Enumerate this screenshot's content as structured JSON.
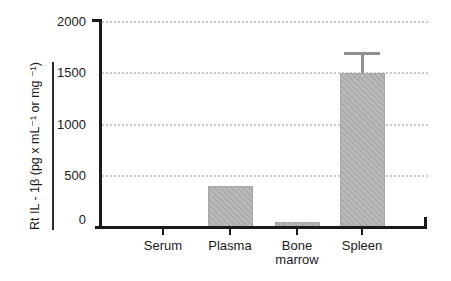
{
  "figure": {
    "background_color": "#ffffff",
    "axis_color": "#1a1a1a",
    "bar_fill_color": "#b5b5b5",
    "error_bar_color": "#8f8f8f",
    "gridline_color": "#cbcbcb",
    "text_color": "#1a1a1a"
  },
  "chart_data": {
    "type": "bar",
    "title": "",
    "xlabel": "",
    "ylabel": "Rt IL - 1β  (pg x mL⁻¹ or mg ⁻¹)",
    "categories": [
      "Serum",
      "Plasma",
      "Bone marrow",
      "Spleen"
    ],
    "values": [
      0,
      400,
      50,
      1500
    ],
    "errors": [
      null,
      null,
      null,
      200
    ],
    "error_direction": "upper-only",
    "ylim": [
      0,
      2000
    ],
    "yticks": [
      0,
      500,
      1000,
      1500,
      2000
    ],
    "ytick_labels": [
      "0",
      "500",
      "1000",
      "1500",
      "2000"
    ],
    "grid": "horizontal dotted lines at each y tick",
    "legend": "none",
    "ylabel_underlined": true
  }
}
